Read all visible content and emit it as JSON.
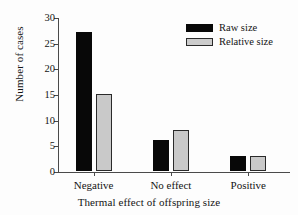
{
  "chart_data": {
    "type": "bar",
    "title": "",
    "xlabel": "Thermal effect of offspring size",
    "ylabel": "Number of cases",
    "categories": [
      "Negative",
      "No effect",
      "Positive"
    ],
    "series": [
      {
        "name": "Raw size",
        "color": "#080808",
        "values": [
          27,
          6,
          3
        ]
      },
      {
        "name": "Relative size",
        "color": "#c9c9c9",
        "values": [
          15,
          8,
          3
        ]
      }
    ],
    "ylim": [
      0,
      30
    ],
    "yticks": [
      0,
      5,
      10,
      15,
      20,
      25,
      30
    ],
    "ytick_labels": [
      "0",
      "5",
      "10",
      "15",
      "20",
      "25",
      "30"
    ],
    "grid": false,
    "legend_position": "top-right"
  },
  "legend": {
    "entries": [
      {
        "label": "Raw size"
      },
      {
        "label": "Relative size"
      }
    ]
  },
  "axes": {
    "y_title": "Number of cases",
    "x_title": "Thermal effect of offspring size",
    "y_labels": [
      "30",
      "25",
      "20",
      "15",
      "10",
      "5",
      "0"
    ],
    "x_labels": [
      "Negative",
      "No effect",
      "Positive"
    ]
  }
}
